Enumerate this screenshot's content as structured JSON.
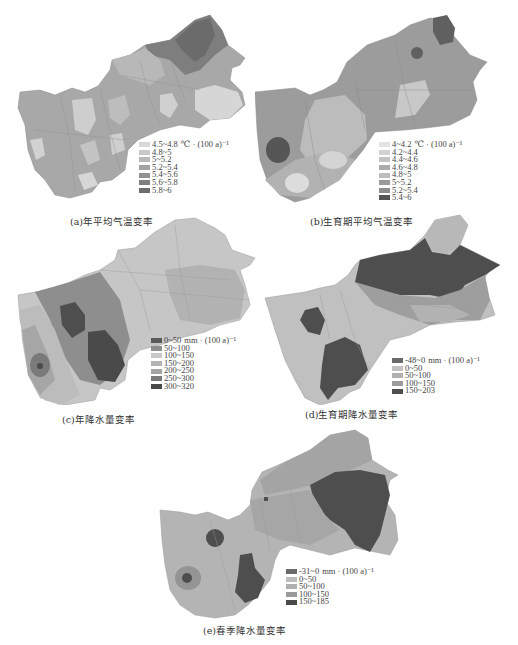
{
  "figure": {
    "panels": [
      {
        "id": "a",
        "caption": "(a)年平均气温变率",
        "legend": {
          "unit": "℃ · (100 a)⁻¹",
          "items": [
            {
              "label": "4.5~4.8",
              "color": "#d8d8d8"
            },
            {
              "label": "4.8~5",
              "color": "#c9c9c9"
            },
            {
              "label": "5~5.2",
              "color": "#b8b8b8"
            },
            {
              "label": "5.2~5.4",
              "color": "#a3a3a3"
            },
            {
              "label": "5.4~5.6",
              "color": "#929292"
            },
            {
              "label": "5.6~5.8",
              "color": "#7f7f7f"
            },
            {
              "label": "5.8~6",
              "color": "#6d6d6d"
            }
          ]
        }
      },
      {
        "id": "b",
        "caption": "(b)生育期平均气温变率",
        "legend": {
          "unit": "℃ · (100 a)⁻¹",
          "items": [
            {
              "label": "4~4.2",
              "color": "#e3e3e3"
            },
            {
              "label": "4.2~4.4",
              "color": "#d2d2d2"
            },
            {
              "label": "4.4~4.6",
              "color": "#c3c3c3"
            },
            {
              "label": "4.6~4.8",
              "color": "#ababab"
            },
            {
              "label": "4.8~5",
              "color": "#bdbdbd"
            },
            {
              "label": "5~5.2",
              "color": "#9a9a9a"
            },
            {
              "label": "5.2~5.4",
              "color": "#8c8c8c"
            },
            {
              "label": "5.4~6",
              "color": "#555555"
            }
          ]
        }
      },
      {
        "id": "c",
        "caption": "(c)年降水量变率",
        "legend": {
          "unit": "mm · (100 a)⁻¹",
          "items": [
            {
              "label": "0~50",
              "color": "#5a5a5a"
            },
            {
              "label": "50~100",
              "color": "#8e8e8e"
            },
            {
              "label": "100~150",
              "color": "#c8c8c8"
            },
            {
              "label": "150~200",
              "color": "#b4b4b4"
            },
            {
              "label": "200~250",
              "color": "#a4a4a4"
            },
            {
              "label": "250~300",
              "color": "#7a7a7a"
            },
            {
              "label": "300~320",
              "color": "#4a4a4a"
            }
          ]
        }
      },
      {
        "id": "d",
        "caption": "(d)生育期降水量变率",
        "legend": {
          "unit": "mm · (100 a)⁻¹",
          "items": [
            {
              "label": "-48~0",
              "color": "#6a6a6a"
            },
            {
              "label": "0~50",
              "color": "#c2c2c2"
            },
            {
              "label": "50~100",
              "color": "#b0b0b0"
            },
            {
              "label": "100~150",
              "color": "#9b9b9b"
            },
            {
              "label": "150~203",
              "color": "#4e4e4e"
            }
          ]
        }
      },
      {
        "id": "e",
        "caption": "(e)春季降水量变率",
        "legend": {
          "unit": "mm · (100 a)⁻¹",
          "items": [
            {
              "label": "-31~0",
              "color": "#6a6a6a"
            },
            {
              "label": "0~50",
              "color": "#bdbdbd"
            },
            {
              "label": "50~100",
              "color": "#b0b0b0"
            },
            {
              "label": "100~150",
              "color": "#9a9a9a"
            },
            {
              "label": "150~185",
              "color": "#4a4a4a"
            }
          ]
        }
      }
    ]
  }
}
